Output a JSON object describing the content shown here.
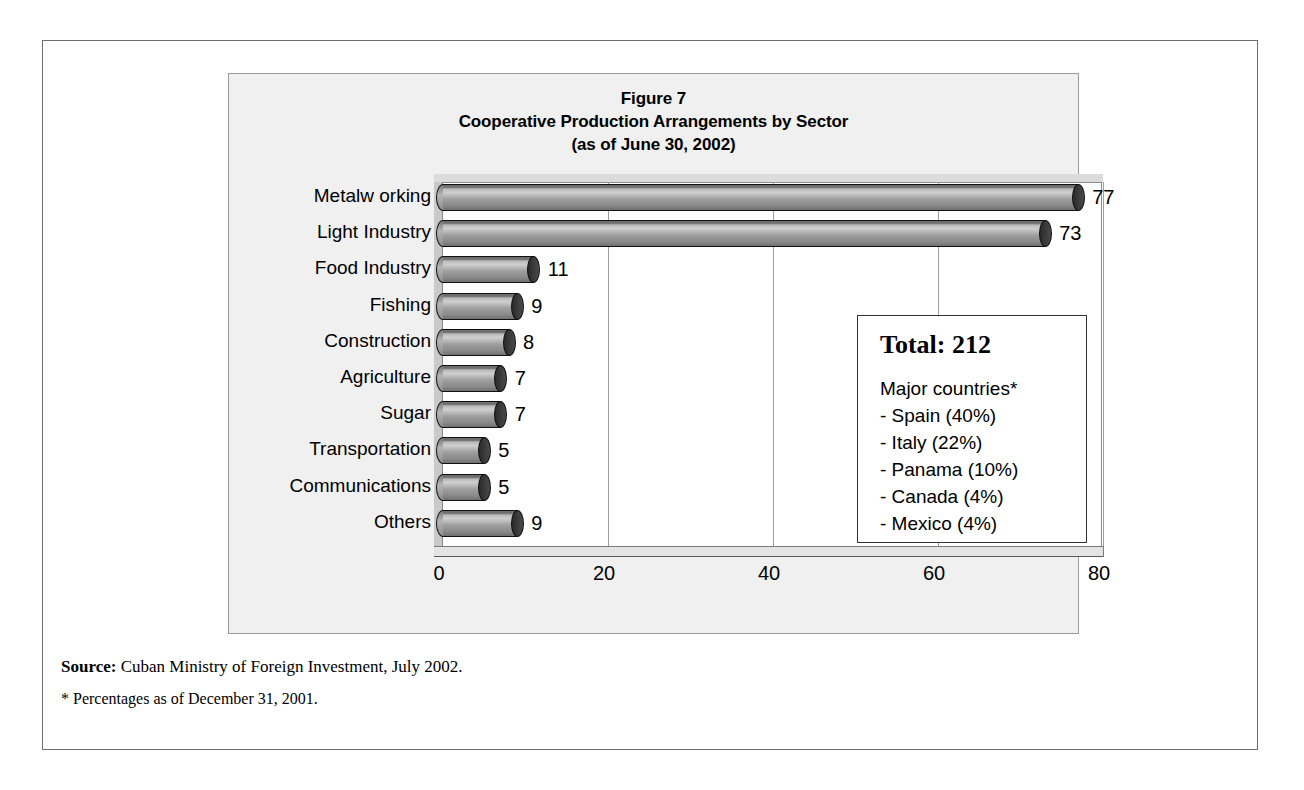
{
  "figure": {
    "title_line1": "Figure 7",
    "title_line2": "Cooperative Production Arrangements by Sector",
    "title_line3": "(as of June 30, 2002)"
  },
  "legend_box": {
    "total_label": "Total: 212",
    "major_heading": "Major countries*",
    "countries": [
      "- Spain (40%)",
      "- Italy (22%)",
      "- Panama (10%)",
      "- Canada (4%)",
      "- Mexico (4%)"
    ]
  },
  "notes": {
    "source_label": "Source:",
    "source_text": " Cuban Ministry of Foreign Investment, July 2002.",
    "footnote": "* Percentages as of December 31, 2001."
  },
  "chart_data": {
    "type": "bar",
    "orientation": "horizontal",
    "xlabel": "",
    "ylabel": "",
    "xlim": [
      0,
      80
    ],
    "xticks": [
      0,
      20,
      40,
      60,
      80
    ],
    "xtick_labels": [
      "0",
      "20",
      "40",
      "60",
      "80"
    ],
    "grid": true,
    "grid_axis": "x",
    "legend": false,
    "style_3d": true,
    "bar_color": "#9d9d9d",
    "categories": [
      "Metalw orking",
      "Light Industry",
      "Food Industry",
      "Fishing",
      "Construction",
      "Agriculture",
      "Sugar",
      "Transportation",
      "Communications",
      "Others"
    ],
    "values": [
      77,
      73,
      11,
      9,
      8,
      7,
      7,
      5,
      5,
      9
    ],
    "data_labels": [
      "77",
      "73",
      "11",
      "9",
      "8",
      "7",
      "7",
      "5",
      "5",
      "9"
    ],
    "total": 212
  }
}
